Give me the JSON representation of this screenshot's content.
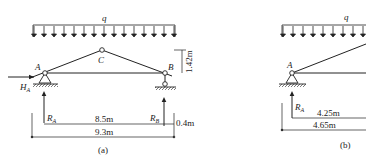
{
  "figure_a": {
    "caption": "(a)",
    "load_label": "q",
    "joints": {
      "A": "A",
      "B": "B",
      "C": "C"
    },
    "horizontal_reaction": {
      "main": "H",
      "sub": "A"
    },
    "reaction_A": {
      "main": "R",
      "sub": "A"
    },
    "reaction_B": {
      "main": "R",
      "sub": "B"
    },
    "dimensions": {
      "span": "8.5m",
      "total": "9.3m",
      "rise": "1.42m",
      "offset": "0.4m"
    }
  },
  "figure_b": {
    "caption": "(b)",
    "load_label": "q",
    "joints": {
      "A": "A"
    },
    "reaction_A": {
      "main": "R",
      "sub": "A"
    },
    "dimensions": {
      "half_span": "4.25m",
      "half_total": "4.65m"
    }
  },
  "colors": {
    "line": "#222222",
    "background": "#ffffff"
  }
}
